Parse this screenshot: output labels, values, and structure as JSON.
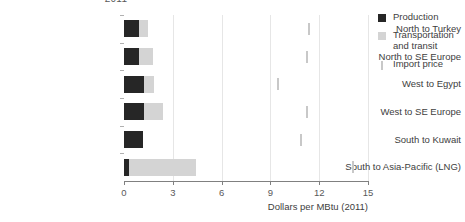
{
  "chart_data": {
    "type": "bar",
    "orientation": "horizontal",
    "stacked": true,
    "title": "2011",
    "xlabel": "Dollars per MBtu (2011)",
    "ylabel": "",
    "xlim": [
      0,
      15
    ],
    "xticks": [
      0,
      3,
      6,
      9,
      12,
      15
    ],
    "xticklabels": [
      "0",
      "3",
      "6",
      "9",
      "12",
      "15"
    ],
    "grid": "vertical",
    "legend_position": "right",
    "categories": [
      "North to Turkey",
      "North to SE Europe",
      "West to Egypt",
      "West to SE Europe",
      "South to Kuwait",
      "South to Asia-Pacific (LNG)"
    ],
    "series": [
      {
        "name": "Production",
        "color": "#262626",
        "values": [
          0.95,
          0.95,
          1.25,
          1.25,
          1.15,
          0.3
        ]
      },
      {
        "name": "Transportation and transit",
        "color": "#d4d4d4",
        "values": [
          0.5,
          0.85,
          0.6,
          1.15,
          0.0,
          4.1
        ]
      },
      {
        "name": "Import price",
        "color": "#c8c8c8",
        "marker": "vertical-line",
        "values": [
          11.3,
          11.2,
          9.4,
          11.2,
          10.8,
          14.0
        ]
      }
    ]
  },
  "legend": {
    "items": [
      {
        "label": "Production",
        "swatch": "production-swatch"
      },
      {
        "label": "Transportation and transit",
        "swatch": "transportation-swatch"
      },
      {
        "label": "Import price",
        "swatch": "import-price-swatch"
      }
    ]
  }
}
